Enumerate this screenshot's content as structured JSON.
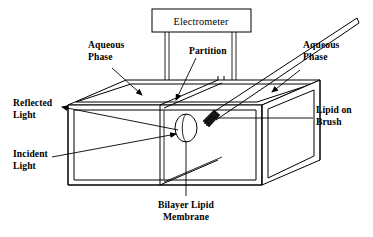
{
  "figure": {
    "type": "line-diagram",
    "background_color": "#ffffff",
    "line_color": "#000000"
  },
  "instrument": {
    "label": "Electrometer",
    "lead_count": 2
  },
  "labels": {
    "aqueous_phase_left_line1": "Aqueous",
    "aqueous_phase_left_line2": "Phase",
    "aqueous_phase_right_line1": "Aqueous",
    "aqueous_phase_right_line2": "Phase",
    "partition": "Partition",
    "reflected_light_line1": "Reflected",
    "reflected_light_line2": "Light",
    "incident_light_line1": "Incident",
    "incident_light_line2": "Light",
    "lipid_on_brush_line1": "Lipid on",
    "lipid_on_brush_line2": "Brush",
    "bilayer_line1": "Bilayer Lipid",
    "bilayer_line2": "Membrane"
  },
  "parts": [
    {
      "name": "electrometer",
      "label": "Electrometer"
    },
    {
      "name": "electrode-lead-left",
      "label": ""
    },
    {
      "name": "electrode-lead-right",
      "label": ""
    },
    {
      "name": "aqueous-phase-left",
      "label": "Aqueous Phase"
    },
    {
      "name": "aqueous-phase-right",
      "label": "Aqueous Phase"
    },
    {
      "name": "partition",
      "label": "Partition"
    },
    {
      "name": "bilayer-lipid-membrane",
      "label": "Bilayer Lipid Membrane"
    },
    {
      "name": "lipid-on-brush",
      "label": "Lipid on Brush"
    },
    {
      "name": "incident-light",
      "label": "Incident Light"
    },
    {
      "name": "reflected-light",
      "label": "Reflected Light"
    },
    {
      "name": "trough-box",
      "label": ""
    }
  ]
}
